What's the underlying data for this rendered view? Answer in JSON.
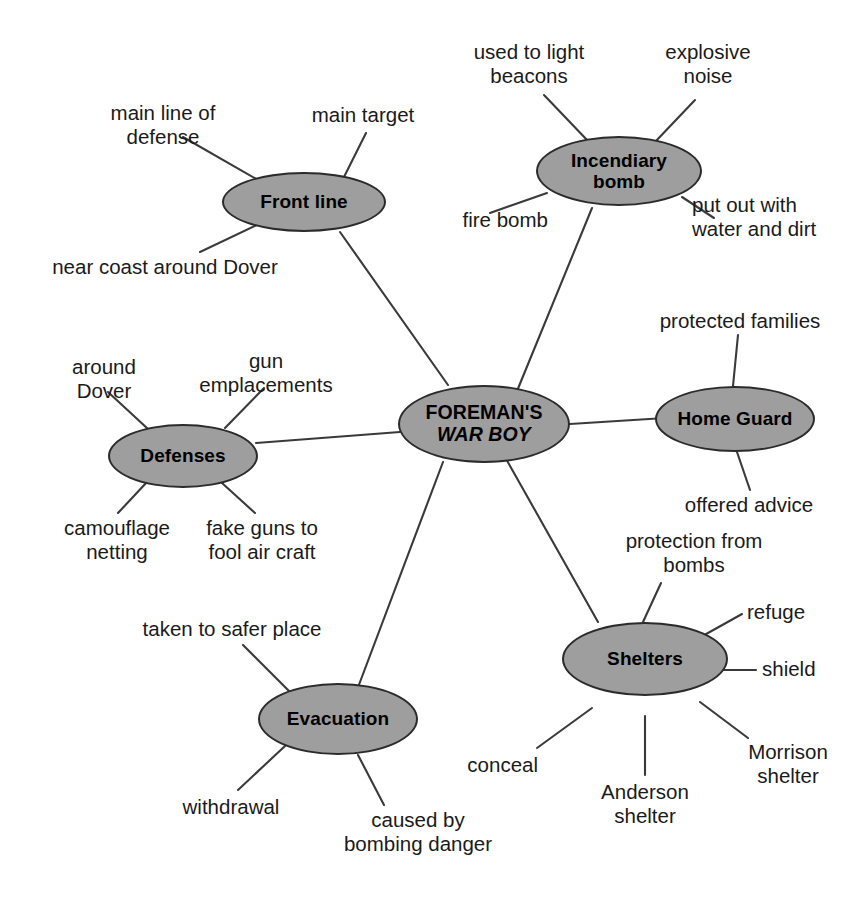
{
  "diagram": {
    "type": "mind-map",
    "background_color": "#ffffff",
    "node_fill_color": "#9e9e9e",
    "node_border_color": "#2b2b2b",
    "edge_color": "#3a3a3a",
    "text_color": "#1a1a1a"
  },
  "center": {
    "line1": "FOREMAN'S",
    "line2": "WAR BOY"
  },
  "branches": [
    {
      "id": "front-line",
      "label": "Front line",
      "leaves": [
        "main line of\ndefense",
        "main target",
        "near coast around Dover"
      ]
    },
    {
      "id": "incendiary-bomb",
      "label": "Incendiary\nbomb",
      "leaves": [
        "used to light\nbeacons",
        "explosive\nnoise",
        "fire bomb",
        "put out with\nwater and dirt"
      ]
    },
    {
      "id": "home-guard",
      "label": "Home Guard",
      "leaves": [
        "protected families",
        "offered advice"
      ]
    },
    {
      "id": "defenses",
      "label": "Defenses",
      "leaves": [
        "around\nDover",
        "gun\nemplacements",
        "camouflage\nnetting",
        "fake guns to\nfool air craft"
      ]
    },
    {
      "id": "shelters",
      "label": "Shelters",
      "leaves": [
        "protection from\nbombs",
        "refuge",
        "shield",
        "Morrison\nshelter",
        "Anderson\nshelter",
        "conceal"
      ]
    },
    {
      "id": "evacuation",
      "label": "Evacuation",
      "leaves": [
        "taken to safer place",
        "withdrawal",
        "caused by\nbombing danger"
      ]
    }
  ],
  "labels": {
    "center_l1": "FOREMAN'S",
    "center_l2": "WAR BOY",
    "front_line": "Front line",
    "front_line_leaf_1": "main line of\ndefense",
    "front_line_leaf_2": "main target",
    "front_line_leaf_3": "near coast around Dover",
    "incendiary_l1": "Incendiary",
    "incendiary_l2": "bomb",
    "incendiary_leaf_1": "used to light\nbeacons",
    "incendiary_leaf_2": "explosive\nnoise",
    "incendiary_leaf_3": "fire bomb",
    "incendiary_leaf_4": "put out with\nwater and dirt",
    "home_guard": "Home Guard",
    "home_guard_leaf_1": "protected families",
    "home_guard_leaf_2": "offered advice",
    "defenses": "Defenses",
    "defenses_leaf_1": "around\nDover",
    "defenses_leaf_2": "gun\nemplacements",
    "defenses_leaf_3": "camouflage\nnetting",
    "defenses_leaf_4": "fake guns to\nfool air craft",
    "shelters": "Shelters",
    "shelters_leaf_1": "protection from\nbombs",
    "shelters_leaf_2": "refuge",
    "shelters_leaf_3": "shield",
    "shelters_leaf_4": "Morrison\nshelter",
    "shelters_leaf_5": "Anderson\nshelter",
    "shelters_leaf_6": "conceal",
    "evacuation": "Evacuation",
    "evacuation_leaf_1": "taken to safer place",
    "evacuation_leaf_2": "withdrawal",
    "evacuation_leaf_3": "caused by\nbombing danger"
  }
}
